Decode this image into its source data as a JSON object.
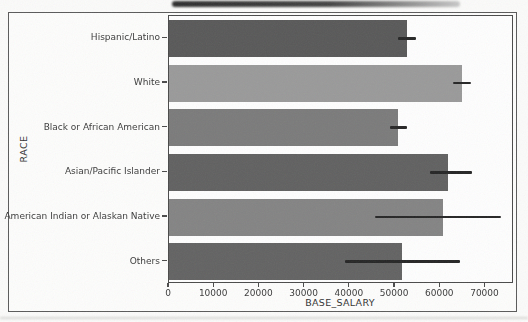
{
  "figure": {
    "background": "#fdfdfc",
    "border_color": "#5a5a5a",
    "axis_color": "#4a4a4a",
    "tick_text_color": "#3b3b3b"
  },
  "chart_data": {
    "type": "bar",
    "orientation": "horizontal",
    "title": "",
    "xlabel": "BASE_SALARY",
    "ylabel": "RACE",
    "categories": [
      "Hispanic/Latino",
      "White",
      "Black or African American",
      "Asian/Pacific Islander",
      "American Indian or Alaskan Native",
      "Others"
    ],
    "values": [
      52600,
      64800,
      50700,
      61700,
      60600,
      51500
    ],
    "error_low": [
      50700,
      62800,
      48900,
      57700,
      45600,
      38900
    ],
    "error_high": [
      54700,
      66800,
      52700,
      67000,
      73500,
      64400
    ],
    "bar_colors": [
      "#595959",
      "#9a9a9a",
      "#7b7b7b",
      "#616161",
      "#848484",
      "#636363"
    ],
    "error_color": "#262626",
    "xticks": [
      0,
      10000,
      20000,
      30000,
      40000,
      50000,
      60000,
      70000
    ],
    "xlim": [
      0,
      76300
    ],
    "grid": false,
    "legend": "none"
  }
}
